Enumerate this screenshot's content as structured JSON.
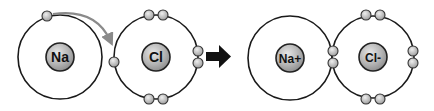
{
  "colors": {
    "shell": "#1a1a1a",
    "nucleus_fill": "#b8b8b8",
    "electron_fill": "#bdbdbd",
    "transfer_arrow": "#8a8a8a",
    "reaction_arrow": "#111111",
    "label": "#111111"
  },
  "atoms": [
    {
      "id": "na",
      "label": "Na",
      "cx": 60,
      "cy": 57,
      "shell_r": 42,
      "electrons": [
        [
          47,
          16
        ]
      ]
    },
    {
      "id": "cl",
      "label": "Cl",
      "cx": 156,
      "cy": 57,
      "shell_r": 42,
      "electrons": [
        [
          114,
          62
        ],
        [
          149,
          15
        ],
        [
          163,
          15
        ],
        [
          149,
          99
        ],
        [
          163,
          99
        ],
        [
          198,
          51
        ],
        [
          198,
          63
        ]
      ]
    },
    {
      "id": "na-ion",
      "label": "Na+",
      "cx": 290,
      "cy": 58,
      "shell_r": 42,
      "electrons": []
    },
    {
      "id": "cl-ion",
      "label": "Cl-",
      "cx": 373,
      "cy": 57,
      "shell_r": 41,
      "electrons": [
        [
          366,
          15
        ],
        [
          380,
          15
        ],
        [
          366,
          99
        ],
        [
          380,
          99
        ],
        [
          333,
          51
        ],
        [
          333,
          63
        ],
        [
          413,
          51
        ],
        [
          413,
          63
        ]
      ]
    }
  ],
  "transfer_arrow": {
    "label": "electron transfer"
  },
  "reaction_arrow": {
    "label": "reaction arrow"
  }
}
